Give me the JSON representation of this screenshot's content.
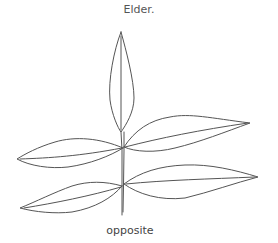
{
  "diagram": {
    "title": "Elder.",
    "caption": "opposite",
    "parts": [
      "terminal-leaflet",
      "upper-left-leaflet",
      "upper-right-leaflet",
      "lower-left-leaflet",
      "lower-right-leaflet",
      "stem"
    ],
    "stroke_color": "#555555"
  }
}
